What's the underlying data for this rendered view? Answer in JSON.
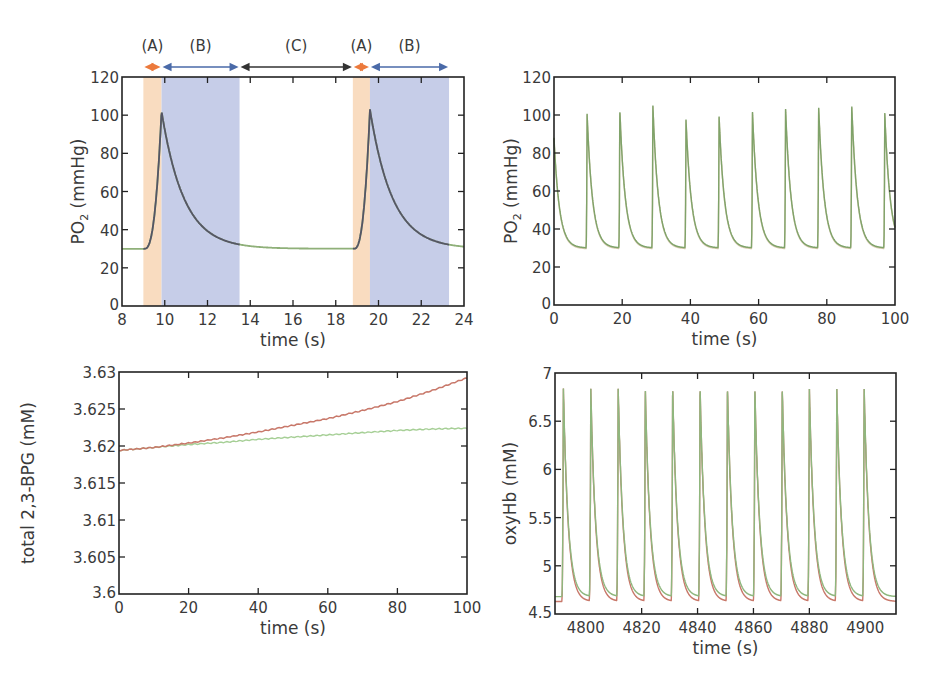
{
  "figure": {
    "background": "#ffffff",
    "colors": {
      "axis": "#222222",
      "region_A": "#f9dcc0",
      "region_B": "#c6cde8",
      "arrow_A": "#ec7a3c",
      "arrow_B": "#4a6aa8",
      "arrow_C": "#333333",
      "trace_green": "#8fb079",
      "trace_dark": "#555566",
      "trace_red": "#c8786a",
      "trace_green_light": "#a6cf96"
    }
  },
  "chart_data": [
    {
      "id": "top-left",
      "type": "line",
      "title": "",
      "xlabel": "time (s)",
      "ylabel_main": "PO",
      "ylabel_sub": "2",
      "ylabel_rest": " (mmHg)",
      "xlim": [
        8,
        24
      ],
      "ylim": [
        0,
        120
      ],
      "xticks": [
        8,
        10,
        12,
        14,
        16,
        18,
        20,
        22,
        24
      ],
      "yticks": [
        0,
        20,
        40,
        60,
        80,
        100,
        120
      ],
      "grid": false,
      "regions": [
        {
          "label": "(A)",
          "x0": 9.0,
          "x1": 9.85,
          "type": "A"
        },
        {
          "label": "(B)",
          "x0": 9.85,
          "x1": 13.5,
          "type": "B"
        },
        {
          "label": "(C)",
          "x0": 13.5,
          "x1": 18.8,
          "type": "C"
        },
        {
          "label": "(A)",
          "x0": 18.8,
          "x1": 19.6,
          "type": "A"
        },
        {
          "label": "(B)",
          "x0": 19.6,
          "x1": 23.3,
          "type": "B"
        }
      ],
      "series": [
        {
          "name": "PO2",
          "baseline": 30,
          "pulses": [
            {
              "rise_start": 9.05,
              "peak_time": 9.85,
              "peak": 102,
              "decay_tau": 1.05
            },
            {
              "rise_start": 18.85,
              "peak_time": 19.6,
              "peak": 103,
              "decay_tau": 1.05
            }
          ]
        }
      ]
    },
    {
      "id": "top-right",
      "type": "line",
      "title": "",
      "xlabel": "time (s)",
      "ylabel_main": "PO",
      "ylabel_sub": "2",
      "ylabel_rest": " (mmHg)",
      "xlim": [
        0,
        100
      ],
      "ylim": [
        0,
        120
      ],
      "xticks": [
        0,
        20,
        40,
        60,
        80,
        100
      ],
      "yticks": [
        0,
        20,
        40,
        60,
        80,
        100,
        120
      ],
      "grid": false,
      "series": [
        {
          "name": "PO2 (two overlapping traces)",
          "baseline": 30,
          "decay_tau": 1.6,
          "initial_value": 88,
          "peak_times": [
            9.7,
            19.3,
            29.0,
            38.7,
            48.4,
            58.2,
            67.9,
            77.6,
            87.3,
            97.0
          ],
          "peaks": [
            101,
            103,
            105,
            98,
            100,
            102,
            104,
            105,
            106,
            101
          ]
        }
      ]
    },
    {
      "id": "bottom-left",
      "type": "line",
      "title": "",
      "xlabel": "time (s)",
      "ylabel": "total 2,3-BPG (mM)",
      "xlim": [
        0,
        100
      ],
      "ylim": [
        3.6,
        3.63
      ],
      "xticks": [
        0,
        20,
        40,
        60,
        80,
        100
      ],
      "yticks": [
        3.6,
        3.605,
        3.61,
        3.615,
        3.62,
        3.625,
        3.63
      ],
      "ytick_labels": [
        "3.6",
        "3.605",
        "3.61",
        "3.615",
        "3.62",
        "3.625",
        "3.63"
      ],
      "grid": false,
      "series": [
        {
          "name": "red",
          "x": [
            0,
            10,
            20,
            30,
            40,
            50,
            60,
            70,
            80,
            90,
            100
          ],
          "values": [
            3.6194,
            3.6198,
            3.6204,
            3.6211,
            3.6219,
            3.6228,
            3.6237,
            3.6248,
            3.626,
            3.6275,
            3.6292
          ]
        },
        {
          "name": "green",
          "x": [
            0,
            10,
            20,
            30,
            40,
            50,
            60,
            70,
            80,
            90,
            100
          ],
          "values": [
            3.6194,
            3.6198,
            3.6202,
            3.6205,
            3.6209,
            3.6212,
            3.6215,
            3.6218,
            3.6221,
            3.6223,
            3.6224
          ]
        }
      ]
    },
    {
      "id": "bottom-right",
      "type": "line",
      "title": "",
      "xlabel": "time (s)",
      "ylabel": "oxyHb (mM)",
      "xlim": [
        4789,
        4911
      ],
      "ylim": [
        4.5,
        7
      ],
      "xticks": [
        4800,
        4820,
        4840,
        4860,
        4880,
        4900
      ],
      "yticks": [
        4.5,
        5,
        5.5,
        6,
        6.5,
        7
      ],
      "ytick_labels": [
        "4.5",
        "5",
        "5.5",
        "6",
        "6.5",
        "7"
      ],
      "grid": false,
      "series": [
        {
          "name": "red",
          "baseline": 4.63,
          "peak": 6.85,
          "decay_tau": 1.7
        },
        {
          "name": "green",
          "baseline": 4.68,
          "peak": 6.85,
          "decay_tau": 1.7
        }
      ],
      "peak_times": [
        4792.0,
        4801.8,
        4811.6,
        4821.3,
        4831.1,
        4840.9,
        4850.7,
        4860.5,
        4870.3,
        4880.0,
        4889.8,
        4899.6
      ]
    }
  ],
  "labels": {
    "time_axis": "time (s)"
  }
}
